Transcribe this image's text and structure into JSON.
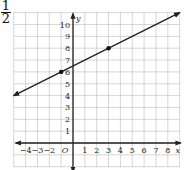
{
  "header": {
    "fraction_numerator": "1",
    "fraction_denominator": "2"
  },
  "chart_data": {
    "type": "line",
    "title": "",
    "xlabel": "x",
    "ylabel": "y",
    "origin_label": "O",
    "xlim": [
      -5,
      9
    ],
    "ylim": [
      -2,
      11
    ],
    "grid": true,
    "x_tick_labels": [
      "-4",
      "-3",
      "-2",
      "1",
      "2",
      "3",
      "4",
      "5",
      "6",
      "7",
      "8"
    ],
    "y_tick_labels": [
      "1",
      "2",
      "3",
      "4",
      "5",
      "6",
      "7",
      "8",
      "9",
      "10"
    ],
    "series": [
      {
        "name": "y = 1/2 x + 6.5",
        "slope": 0.5,
        "intercept": 6.5,
        "x": [
          -5,
          9
        ],
        "y": [
          4,
          11
        ],
        "arrows": "both"
      }
    ],
    "points": [
      {
        "x": -1,
        "y": 6
      },
      {
        "x": 3,
        "y": 8
      }
    ],
    "colors": {
      "line": "#222222",
      "grid": "#bbbbbb",
      "axis": "#222222"
    }
  }
}
